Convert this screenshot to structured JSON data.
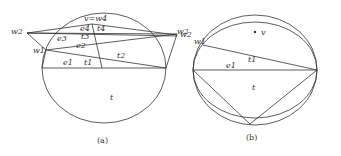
{
  "figure_a": {
    "caption": "(a)",
    "labels": {
      "v_eq_w4": "v=w4",
      "w2_left": "w2",
      "w2_right": "w2",
      "w1": "w1",
      "e4": "e4",
      "t4": "t4",
      "e3": "e3",
      "t3": "t3",
      "e2": "e2",
      "t2": "t2",
      "e1": "e1",
      "t1": "t1",
      "t": "t"
    }
  },
  "figure_b": {
    "caption": "(b)",
    "labels": {
      "w2": "w2",
      "w1": "w1",
      "v": "v",
      "e1": "e1",
      "t1": "t1",
      "t": "t"
    }
  },
  "colors": {
    "stroke": "#333333",
    "background": "#ffffff"
  }
}
